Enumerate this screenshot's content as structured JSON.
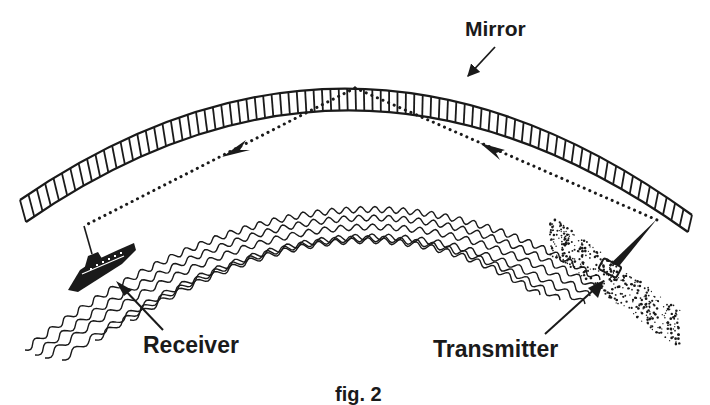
{
  "diagram": {
    "type": "over-the-horizon radio propagation illustration",
    "labels": {
      "mirror": "Mirror",
      "receiver": "Receiver",
      "transmitter": "Transmitter",
      "caption": "fig. 2"
    },
    "elements": [
      {
        "name": "mirror-arc",
        "description": "hatched curved reflective layer spanning the top of the figure"
      },
      {
        "name": "mirror-pointer-arrow",
        "description": "arrow from the 'Mirror' label to the arc"
      },
      {
        "name": "incident-ray",
        "description": "dotted line from transmitter up to the mirror, arrow pointing toward the mirror"
      },
      {
        "name": "reflected-ray",
        "description": "dotted line from the mirror down to the receiver, arrow pointing toward the receiver"
      },
      {
        "name": "earth-surface-waves",
        "description": "wavy concentric lines depicting the curved ocean surface between stations"
      },
      {
        "name": "receiver-ship",
        "description": "ship with antenna mast at the lower left"
      },
      {
        "name": "transmitter-station",
        "description": "antenna spike and vehicle on the shoreline at the lower right"
      }
    ],
    "colors": {
      "ink": "#1a1a1a",
      "background": "#ffffff"
    }
  }
}
